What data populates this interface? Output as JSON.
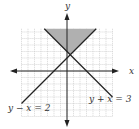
{
  "chart_data": {
    "type": "line",
    "title": "",
    "xlabel": "x",
    "ylabel": "y",
    "xlim": [
      -7,
      7
    ],
    "ylim": [
      -7,
      6.5
    ],
    "grid": true,
    "series": [
      {
        "name": "y - x = 2",
        "equation": "y = x + 2",
        "x": [
          -7,
          4.5
        ],
        "y": [
          -5,
          6.5
        ]
      },
      {
        "name": "y + x = 3",
        "equation": "y = -x + 3",
        "x": [
          -3.5,
          7
        ],
        "y": [
          6.5,
          -4
        ]
      }
    ],
    "shaded_region": {
      "description": "y >= x + 2 and y >= -x + 3",
      "vertices": [
        [
          -3.5,
          6.5
        ],
        [
          4.5,
          6.5
        ],
        [
          0.5,
          2.5
        ]
      ],
      "color": "#b0b0b0"
    },
    "intersection": [
      0.5,
      2.5
    ],
    "annotations": [
      "y − x = 2",
      "y + x = 3"
    ]
  },
  "labels": {
    "x_axis": "x",
    "y_axis": "y",
    "line1": "y − x = 2",
    "line2": "y + x = 3"
  }
}
